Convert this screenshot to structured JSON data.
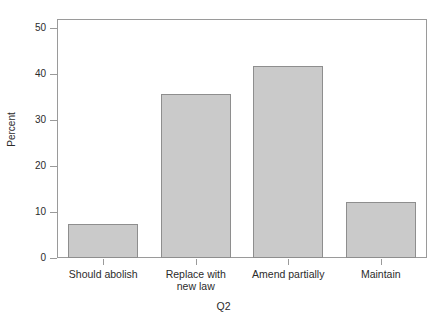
{
  "chart_data": {
    "type": "bar",
    "title": "",
    "subtitle": "",
    "xlabel": "Q2",
    "ylabel": "Percent",
    "categories": [
      "Should abolish",
      "Replace with\nnew law",
      "Amend partially",
      "Maintain"
    ],
    "values": [
      7.4,
      35.6,
      41.8,
      12.1
    ],
    "ylim": [
      0,
      52
    ],
    "yticks": [
      0,
      10,
      20,
      30,
      40,
      50
    ],
    "ytick_labels": [
      "0",
      "10",
      "20",
      "30",
      "40",
      "50"
    ],
    "grid": false,
    "legend": false,
    "legend_position": "none",
    "bar_fill_color": "#cacaca",
    "bar_edge_color": "#8e8e8e",
    "axis_color": "#9a9a9a",
    "text_color": "#2b2b2b",
    "background_color": "#ffffff",
    "series": [
      {
        "name": "Percent",
        "values": [
          7.4,
          35.6,
          41.8,
          12.1
        ]
      }
    ]
  }
}
